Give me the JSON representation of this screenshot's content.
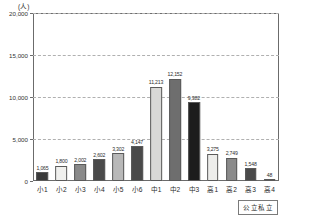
{
  "chart_data": {
    "type": "bar",
    "title": "",
    "subtitle": "",
    "unit_label": "(人)",
    "xlabel": "",
    "ylabel": "",
    "ylim": [
      0,
      20000
    ],
    "ytick_values": [
      0,
      5000,
      10000,
      15000,
      20000
    ],
    "ytick_labels": [
      "0",
      "5,000",
      "10,000",
      "15,000",
      "20,000"
    ],
    "grid": true,
    "grid_axis": "y",
    "legend_position": "bottom-right",
    "legend_label": "公立私立",
    "categories": [
      "小1",
      "小2",
      "小3",
      "小4",
      "小5",
      "小6",
      "中1",
      "中2",
      "中3",
      "高1",
      "高2",
      "高3",
      "高4"
    ],
    "values": [
      1065,
      1800,
      2002,
      2602,
      3302,
      4147,
      11213,
      12152,
      9382,
      3275,
      2749,
      1548,
      48
    ],
    "value_labels": [
      "1,065",
      "1,800",
      "2,002",
      "2,602",
      "3,302",
      "4,147",
      "11,213",
      "12,152",
      "9,382",
      "3,275",
      "2,749",
      "1,548",
      "48"
    ],
    "bar_colors": [
      "#3a3a3a",
      "#f0f0ee",
      "#8a8a8a",
      "#4a4a4a",
      "#b8b8b8",
      "#4a4a4a",
      "#d8d8d6",
      "#6e6e6e",
      "#1c1c1c",
      "#ededeb",
      "#8a8a8a",
      "#4a4a4a",
      "#8a8a8a"
    ],
    "series": [
      {
        "name": "公立私立",
        "values": [
          1065,
          1800,
          2002,
          2602,
          3302,
          4147,
          11213,
          12152,
          9382,
          3275,
          2749,
          1548,
          48
        ]
      }
    ]
  }
}
